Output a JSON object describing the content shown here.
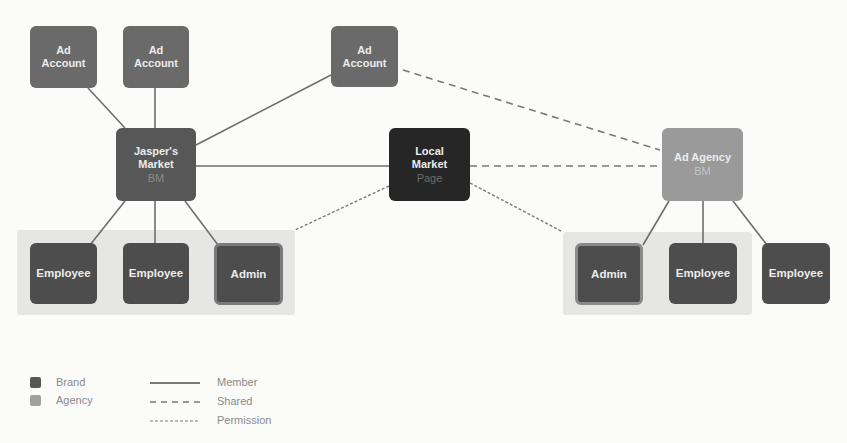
{
  "diagram": {
    "colors": {
      "background": "#fbfbfa",
      "group_background": "#e6e6e4",
      "ad_account": "#6a6a6a",
      "brand_bm": "#575757",
      "page": "#262626",
      "agency_bm": "#9a9a9a",
      "employee": "#4d4d4d",
      "edge": "#707070"
    },
    "nodes": {
      "ad_account_1": {
        "title": "Ad",
        "subtitle": "Account"
      },
      "ad_account_2": {
        "title": "Ad",
        "subtitle": "Account"
      },
      "ad_account_3": {
        "title": "Ad",
        "subtitle": "Account"
      },
      "jaspers_market": {
        "title": "Jasper's",
        "subtitle": "Market",
        "type": "BM"
      },
      "local_market": {
        "title": "Local",
        "subtitle": "Market",
        "type": "Page"
      },
      "ad_agency": {
        "title": "Ad Agency",
        "type": "BM"
      },
      "left_employee_1": {
        "label": "Employee"
      },
      "left_employee_2": {
        "label": "Employee"
      },
      "left_admin": {
        "label": "Admin"
      },
      "right_admin": {
        "label": "Admin"
      },
      "right_employee_1": {
        "label": "Employee"
      },
      "right_employee_2": {
        "label": "Employee"
      }
    },
    "edges": [
      {
        "from": "ad_account_1",
        "to": "jaspers_market",
        "style": "Member"
      },
      {
        "from": "ad_account_2",
        "to": "jaspers_market",
        "style": "Member"
      },
      {
        "from": "ad_account_3",
        "to": "jaspers_market",
        "style": "Member"
      },
      {
        "from": "jaspers_market",
        "to": "local_market",
        "style": "Member"
      },
      {
        "from": "jaspers_market",
        "to": "left_employee_1",
        "style": "Member"
      },
      {
        "from": "jaspers_market",
        "to": "left_employee_2",
        "style": "Member"
      },
      {
        "from": "jaspers_market",
        "to": "left_admin",
        "style": "Member"
      },
      {
        "from": "ad_account_3",
        "to": "ad_agency",
        "style": "Shared"
      },
      {
        "from": "local_market",
        "to": "ad_agency",
        "style": "Shared"
      },
      {
        "from": "local_market",
        "to": "left_group",
        "style": "Permission"
      },
      {
        "from": "local_market",
        "to": "right_group",
        "style": "Permission"
      },
      {
        "from": "ad_agency",
        "to": "right_admin",
        "style": "Member"
      },
      {
        "from": "ad_agency",
        "to": "right_employee_1",
        "style": "Member"
      },
      {
        "from": "ad_agency",
        "to": "right_employee_2",
        "style": "Member"
      }
    ]
  },
  "legend": {
    "swatches": [
      {
        "label": "Brand",
        "color": "#575757"
      },
      {
        "label": "Agency",
        "color": "#9a9a9a"
      }
    ],
    "lines": [
      {
        "label": "Member",
        "style": "solid"
      },
      {
        "label": "Shared",
        "style": "dashed"
      },
      {
        "label": "Permission",
        "style": "dotted"
      }
    ]
  }
}
